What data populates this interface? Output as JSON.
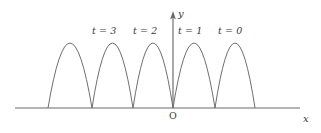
{
  "figure": {
    "background_color": "#ffffff",
    "curve_color": "#5d5d5d",
    "axis_color": "#6a6a6a",
    "text_color": "#3a3a3a",
    "axes": {
      "x_axis_label": "x",
      "y_axis_label": "y",
      "origin_label": "O"
    },
    "curve_labels": [
      {
        "text": "t = 3",
        "x": 92,
        "y": 26
      },
      {
        "text": "t = 2",
        "x": 133,
        "y": 26
      },
      {
        "text": "t = 1",
        "x": 178,
        "y": 26
      },
      {
        "text": "t = 0",
        "x": 218,
        "y": 26
      }
    ]
  },
  "chart_data": {
    "type": "line",
    "title": "",
    "xlabel": "x",
    "ylabel": "y",
    "grid": false,
    "legend_position": "above-curves",
    "axis_geometry": {
      "baseline_y_px": 108,
      "x_axis_from_px": 15,
      "x_axis_to_px": 300,
      "y_axis_x_px": 173,
      "y_axis_top_px": 13,
      "arch_peak_y_px": 43,
      "root_spacing_px": 41
    },
    "series": [
      {
        "name": "t = 0",
        "roots_px": [
          215,
          255
        ],
        "peak_px": [
          235,
          43
        ],
        "label_anchor_px": [
          218,
          26
        ]
      },
      {
        "name": "t = 1",
        "roots_px": [
          173,
          215
        ],
        "peak_px": [
          194,
          43
        ],
        "label_anchor_px": [
          178,
          26
        ]
      },
      {
        "name": "t = 2",
        "roots_px": [
          133,
          173
        ],
        "peak_px": [
          153,
          43
        ],
        "label_anchor_px": [
          133,
          26
        ]
      },
      {
        "name": "t = 3",
        "roots_px": [
          92,
          133
        ],
        "peak_px": [
          112,
          43
        ],
        "label_anchor_px": [
          92,
          26
        ]
      },
      {
        "name": "t = 4 (unlabelled)",
        "roots_px": [
          48,
          92
        ],
        "peak_px": [
          70,
          43
        ],
        "label_anchor_px": null
      }
    ],
    "arch_roots_px": [
      48,
      92,
      133,
      173,
      215,
      255
    ],
    "arch_peaks_px": [
      70,
      112,
      153,
      194,
      235
    ]
  }
}
